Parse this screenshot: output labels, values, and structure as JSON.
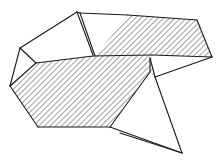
{
  "figure": {
    "canvas": {
      "width": 220,
      "height": 160
    },
    "background_color": "#ffffff",
    "stroke_color": "#1a1a1a",
    "hatch_color": "#2b2b2b",
    "fill_color": "#ffffff",
    "stroke_width": 1.1,
    "hatch_spacing": 4,
    "hatch_angle_deg": 45,
    "caption": "",
    "faces": [
      {
        "name": "upper-left-flap",
        "fill": "plain",
        "points": "20,48 77,12 93,55"
      },
      {
        "name": "upper-left-wing",
        "fill": "plain",
        "points": "20,48 77,12 80,13 93,56 36,63"
      },
      {
        "name": "top-triangle-flap",
        "fill": "plain",
        "points": "80,13 128,15 95,56"
      },
      {
        "name": "large-hatched-body",
        "fill": "hatched",
        "points": "10,86 36,63 93,56 152,55 150,72 110,127 38,127"
      },
      {
        "name": "upper-right-hatched-panel",
        "fill": "hatched",
        "points": "128,15 197,20 212,57 152,55 95,56"
      },
      {
        "name": "right-notch-sliver",
        "fill": "plain",
        "points": "152,55 212,57 155,77"
      },
      {
        "name": "right-lower-hatched-wedge",
        "fill": "hatched",
        "points": "150,58 155,77 150,72"
      },
      {
        "name": "lower-right-open-triangle",
        "fill": "plain",
        "points": "110,127 150,72 182,153"
      },
      {
        "name": "bottom-thin-triangle",
        "fill": "plain",
        "points": "110,127 182,153 120,133"
      }
    ],
    "edges": [
      {
        "name": "edge-left-upper",
        "d": "M 20,48 L 77,12"
      },
      {
        "name": "edge-apex-right",
        "d": "M 77,12 L 93,55"
      },
      {
        "name": "edge-apex-sliver",
        "d": "M 80,13 L 95,56"
      },
      {
        "name": "edge-apex-top-short",
        "d": "M 77,12 L 80,13"
      },
      {
        "name": "edge-top-ridge",
        "d": "M 80,13 L 128,15"
      },
      {
        "name": "edge-top-right-upper",
        "d": "M 128,15 L 197,20"
      },
      {
        "name": "edge-right-outer",
        "d": "M 197,20 L 212,57"
      },
      {
        "name": "edge-left-fold",
        "d": "M 20,48 L 36,63"
      },
      {
        "name": "edge-left-lower",
        "d": "M 20,48 L 10,86"
      },
      {
        "name": "edge-mid-fold",
        "d": "M 36,63 L 93,56"
      },
      {
        "name": "edge-mid-fold-right",
        "d": "M 93,56 L 152,55"
      },
      {
        "name": "edge-left-bottom",
        "d": "M 10,86 L 38,127"
      },
      {
        "name": "edge-bottom",
        "d": "M 38,127 L 110,127"
      },
      {
        "name": "edge-body-right",
        "d": "M 110,127 L 150,72"
      },
      {
        "name": "edge-notch-upper",
        "d": "M 152,55 L 212,57"
      },
      {
        "name": "edge-notch-lower",
        "d": "M 150,58 L 155,77"
      },
      {
        "name": "edge-notch-to-right",
        "d": "M 155,77 L 212,57"
      },
      {
        "name": "edge-wedge-left",
        "d": "M 150,58 L 150,72"
      },
      {
        "name": "edge-lower-right-diag",
        "d": "M 155,77 L 182,153"
      },
      {
        "name": "edge-bottom-tip-left",
        "d": "M 182,153 L 110,127"
      },
      {
        "name": "edge-bottom-tip-inner",
        "d": "M 182,153 L 120,133"
      },
      {
        "name": "edge-hatch-body-top",
        "d": "M 10,86 L 36,63"
      }
    ]
  }
}
